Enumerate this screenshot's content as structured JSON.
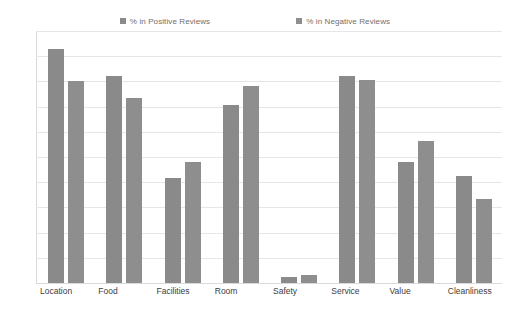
{
  "chart_data": {
    "type": "bar",
    "title": "",
    "subtitle": "",
    "xlabel": "",
    "ylabel": "",
    "ylim": [
      0,
      100
    ],
    "ytick_step": 10,
    "yticks": [
      "100",
      "90",
      "80",
      "70",
      "60",
      "50",
      "40",
      "30",
      "20",
      "10",
      "0"
    ],
    "grid": true,
    "legend_position": "top-center",
    "categories": [
      "Location",
      "Food",
      "Facilities",
      "Room",
      "Safety",
      "Service",
      "Value",
      "Cleanliness"
    ],
    "series": [
      {
        "name": "% in Positive Reviews",
        "color": "#8a8a8a",
        "values": [
          93,
          82,
          41.5,
          70.5,
          2.5,
          82,
          48,
          42.5
        ]
      },
      {
        "name": "% in Negative Reviews",
        "color": "#8e8e8e",
        "values": [
          80,
          73.5,
          48,
          78,
          3,
          80.5,
          56.5,
          33.5
        ]
      }
    ]
  },
  "legend": {
    "items": [
      {
        "label": "% in Positive Reviews",
        "marker": "square-swatch"
      },
      {
        "label": "% in Negative Reviews",
        "marker": "square-swatch"
      }
    ]
  },
  "colors": {
    "positive_series": "#8a8a8a",
    "negative_series": "#8e8e8e",
    "gridline": "#e4e6e8",
    "axis": "#d8dadc",
    "tick_text": "#8d8d8d",
    "category_text": "#3d3d3d",
    "legend_text": "#6f6f6f",
    "background": "#ffffff"
  }
}
